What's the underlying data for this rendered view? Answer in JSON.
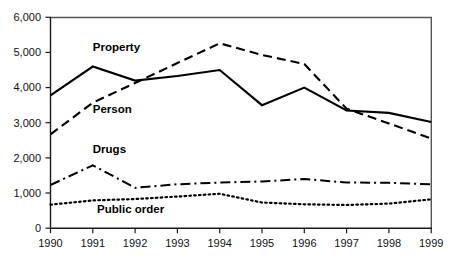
{
  "chart_data": {
    "type": "line",
    "title": "",
    "subtitle": "",
    "xlabel": "",
    "ylabel": "",
    "categories": [
      "1990",
      "1991",
      "1992",
      "1993",
      "1994",
      "1995",
      "1996",
      "1997",
      "1998",
      "1999"
    ],
    "x": [
      1990,
      1991,
      1992,
      1993,
      1994,
      1995,
      1996,
      1997,
      1998,
      1999
    ],
    "xlim": [
      1990,
      1999
    ],
    "ylim": [
      0,
      6000
    ],
    "y_ticks": [
      0,
      1000,
      2000,
      3000,
      4000,
      5000,
      6000
    ],
    "y_tick_labels": [
      "0",
      "1,000",
      "2,000",
      "3,000",
      "4,000",
      "5,000",
      "6,000"
    ],
    "grid": false,
    "legend": "inline-labels",
    "series": [
      {
        "name": "Property",
        "style": "solid",
        "values": [
          3780,
          4600,
          4200,
          4330,
          4500,
          3500,
          4000,
          3350,
          3280,
          3020
        ]
      },
      {
        "name": "Person",
        "style": "dashed",
        "values": [
          2670,
          3570,
          4130,
          4700,
          5260,
          4930,
          4670,
          3400,
          2980,
          2550
        ]
      },
      {
        "name": "Drugs",
        "style": "dash-dot",
        "values": [
          1230,
          1790,
          1150,
          1250,
          1300,
          1330,
          1400,
          1300,
          1290,
          1250
        ]
      },
      {
        "name": "Public order",
        "style": "dotted",
        "values": [
          670,
          790,
          830,
          900,
          980,
          730,
          680,
          660,
          700,
          820
        ]
      }
    ],
    "annotations": [
      {
        "text": "Property",
        "x": 1991.0,
        "y": 5050
      },
      {
        "text": "Person",
        "x": 1991.0,
        "y": 3280
      },
      {
        "text": "Drugs",
        "x": 1991.0,
        "y": 2150
      },
      {
        "text": "Public order",
        "x": 1991.1,
        "y": 430
      }
    ]
  }
}
